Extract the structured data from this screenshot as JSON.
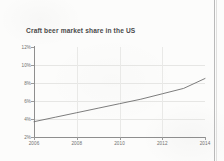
{
  "document": {
    "kind": "scanned-chart-page",
    "background_color": "#fcfcfb",
    "page_edge_color": "#b9b9b9"
  },
  "chart_data": {
    "type": "line",
    "title": "Craft beer market share in the US",
    "xlabel": "",
    "ylabel": "",
    "xlim": [
      2006,
      2014
    ],
    "ylim": [
      2,
      12
    ],
    "grid": true,
    "legend": false,
    "legend_position": "none",
    "line_color": "#6e6e6e",
    "x_tick_labels": [
      "2006",
      "2008",
      "2010",
      "2012",
      "2014"
    ],
    "x_ticks": [
      2006,
      2008,
      2010,
      2012,
      2014
    ],
    "y_tick_labels": [
      "12%",
      "10%",
      "8%",
      "6%",
      "4%",
      "2%"
    ],
    "y_ticks": [
      12,
      10,
      8,
      6,
      4,
      2
    ],
    "series": [
      {
        "name": "Craft beer market share",
        "x": [
          2006,
          2007,
          2008,
          2009,
          2010,
          2011,
          2012,
          2013,
          2014
        ],
        "values": [
          3.7,
          4.2,
          4.7,
          5.2,
          5.7,
          6.2,
          6.8,
          7.4,
          8.5
        ]
      }
    ]
  }
}
